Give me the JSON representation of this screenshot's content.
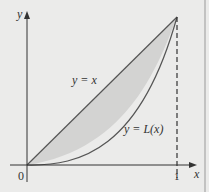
{
  "diagram": {
    "axes": {
      "x_label": "x",
      "y_label": "y",
      "origin_label": "0",
      "x_tick_label": "1"
    },
    "curves": [
      {
        "name": "line",
        "label": "y = x"
      },
      {
        "name": "lorenz",
        "label": "y = L(x)"
      }
    ],
    "colors": {
      "background": "#ebebea",
      "fill": "#d3d3d2",
      "stroke": "#555555",
      "axis": "#333333"
    }
  }
}
